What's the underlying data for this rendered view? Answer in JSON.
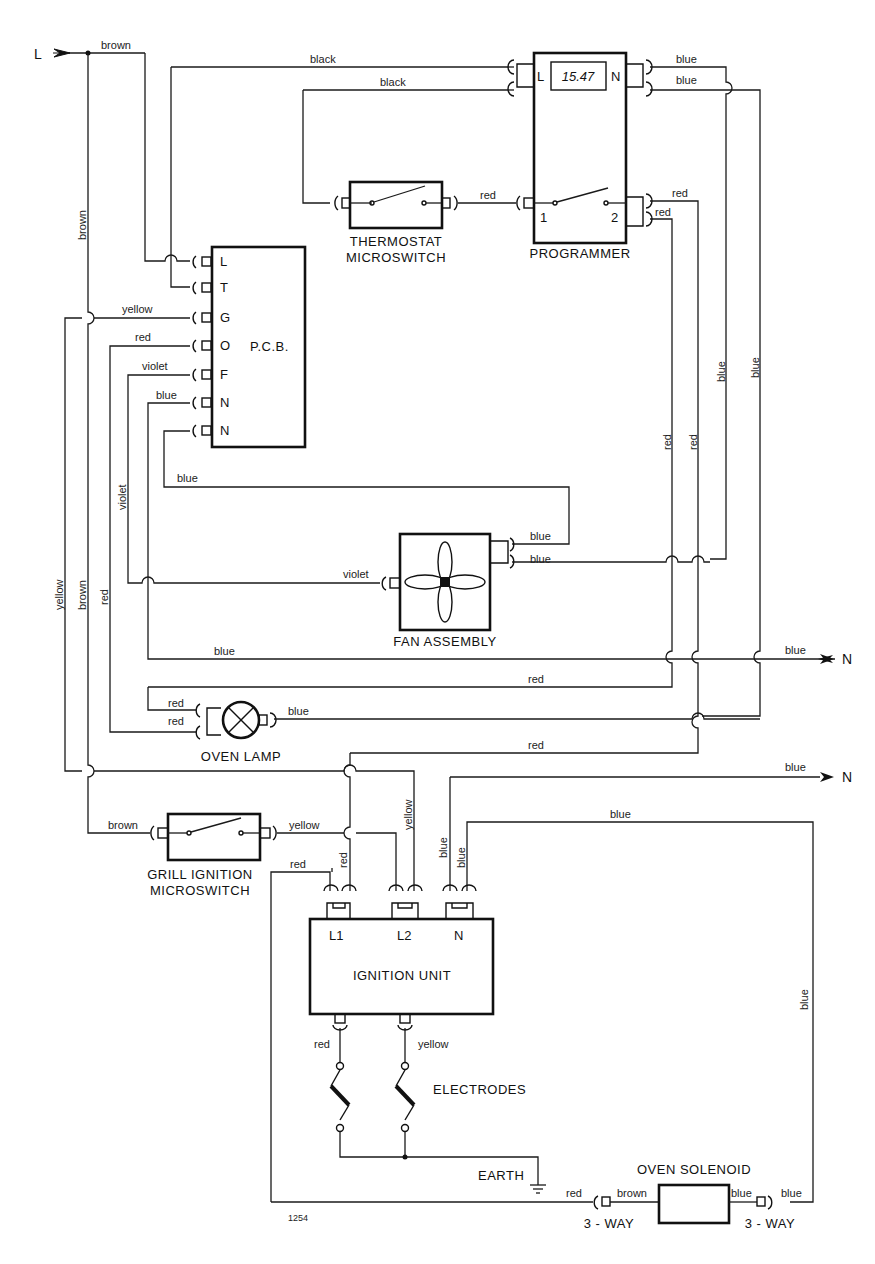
{
  "diagram": {
    "reference_number": "1254",
    "terminals": {
      "supply_live": "L",
      "neutral_top": "N",
      "neutral_bottom": "N"
    },
    "components": {
      "programmer": {
        "label": "PROGRAMMER",
        "display": "15.47",
        "pin_l": "L",
        "pin_n": "N",
        "pin_1": "1",
        "pin_2": "2"
      },
      "thermostat": {
        "label_line1": "THERMOSTAT",
        "label_line2": "MICROSWITCH"
      },
      "pcb": {
        "label": "P.C.B.",
        "pins": [
          "L",
          "T",
          "G",
          "O",
          "F",
          "N",
          "N"
        ]
      },
      "fan": {
        "label": "FAN ASSEMBLY"
      },
      "oven_lamp": {
        "label": "OVEN LAMP"
      },
      "grill_switch": {
        "label_line1": "GRILL IGNITION",
        "label_line2": "MICROSWITCH"
      },
      "ignition_unit": {
        "label": "IGNITION UNIT",
        "pin_l1": "L1",
        "pin_l2": "L2",
        "pin_n": "N"
      },
      "electrodes": {
        "label": "ELECTRODES"
      },
      "earth": {
        "label": "EARTH"
      },
      "oven_solenoid": {
        "label": "OVEN SOLENOID",
        "connector_left": "3 - WAY",
        "connector_right": "3 - WAY"
      }
    },
    "wire_labels": {
      "brown_top": "brown",
      "brown_vertical": "brown",
      "black_1": "black",
      "black_2": "black",
      "blue_prog_1": "blue",
      "blue_prog_2": "blue",
      "red_thermo": "red",
      "red_prog_1": "red",
      "red_prog_2": "red",
      "yellow_g": "yellow",
      "red_o": "red",
      "violet_f": "violet",
      "blue_n1": "blue",
      "blue_n2": "blue",
      "red_v1": "red",
      "red_v2": "red",
      "blue_v1": "blue",
      "blue_v2": "blue",
      "violet_v": "violet",
      "yellow_v": "yellow",
      "brown_v2": "brown",
      "red_v3": "red",
      "fan_blue_1": "blue",
      "fan_blue_2": "blue",
      "fan_violet": "violet",
      "blue_neutral_1": "blue",
      "blue_neutral_1_end": "blue",
      "red_lamp_h": "red",
      "lamp_red_1": "red",
      "lamp_red_2": "red",
      "lamp_blue": "blue",
      "red_ign_h": "red",
      "blue_neutral_2_end": "blue",
      "blue_solenoid_top": "blue",
      "grill_brown": "brown",
      "grill_yellow": "yellow",
      "yellow_v2": "yellow",
      "red_l1_a": "red",
      "red_l1_b": "red",
      "blue_n_a": "blue",
      "blue_n_b": "blue",
      "electrode_red": "red",
      "electrode_yellow": "yellow",
      "solenoid_blue_v": "blue",
      "solenoid_red": "red",
      "solenoid_brown": "brown",
      "solenoid_blue_in": "blue",
      "solenoid_blue_out": "blue"
    }
  }
}
